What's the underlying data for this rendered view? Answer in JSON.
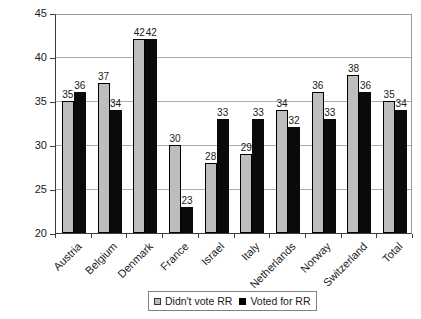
{
  "chart_data": {
    "type": "bar",
    "title": "",
    "categories": [
      "Austria",
      "Belgium",
      "Denmark",
      "France",
      "Israel",
      "Italy",
      "Netherlands",
      "Norway",
      "Switzerland",
      "Total"
    ],
    "series": [
      {
        "name": "Didn't vote RR",
        "color": "#bdbdbd",
        "values": [
          35,
          37,
          42,
          30,
          28,
          29,
          34,
          36,
          38,
          35
        ]
      },
      {
        "name": "Voted for RR",
        "color": "#000000",
        "values": [
          36,
          34,
          42,
          23,
          33,
          33,
          32,
          33,
          36,
          34
        ]
      }
    ],
    "xlabel": "",
    "ylabel": "",
    "ylim": [
      20,
      45
    ],
    "yticks": [
      20,
      25,
      30,
      35,
      40,
      45
    ],
    "grid": true,
    "legend_position": "bottom",
    "bar_value_labels": true
  },
  "colors": {
    "gridline": "#acacac",
    "axis": "#3c3c3c",
    "plot_border": "#9b9b9b",
    "legend_border": "#808080",
    "background": "#ffffff"
  }
}
